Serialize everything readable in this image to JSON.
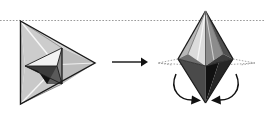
{
  "figure": {
    "width": 264,
    "height": 115,
    "background_color": "#ffffff",
    "caption": ""
  },
  "colors": {
    "outline": "#1a1a1a",
    "dotted_guide": "#9a9a9a",
    "face_light": "#d6d6d6",
    "face_mid": "#b3b3b3",
    "face_midlight": "#c4c4c4",
    "face_dark": "#6e6e6e",
    "face_darker": "#3c3c3c",
    "face_black": "#111111",
    "face_white": "#f2f2f2",
    "arrow": "#111111"
  },
  "guide_line": {
    "name": "horizontal-dotted-guide",
    "y": 20.5,
    "x_start": 0,
    "x_end": 264,
    "dash": "1.6 1.6",
    "color": "#9a9a9a"
  },
  "left_shape": {
    "label": "tetrahedron",
    "vertices": {
      "top_left": [
        20.5,
        21
      ],
      "bottom_left": [
        20.5,
        104
      ],
      "right": [
        95,
        63
      ],
      "inner_top": [
        62,
        48
      ],
      "inner_bottom": [
        62,
        84
      ],
      "inner_left": [
        25,
        66
      ],
      "inner_center": [
        57,
        66
      ]
    },
    "faces": [
      {
        "name": "outer-upper-face",
        "fill": "#d6d6d6",
        "points": "20.5,21 95,63 62,48"
      },
      {
        "name": "outer-lower-face",
        "fill": "#cfcfcf",
        "points": "20.5,104 95,63 62,84"
      },
      {
        "name": "outer-left-face",
        "fill": "#c4c4c4",
        "points": "20.5,21 20.5,104 25,66"
      },
      {
        "name": "inner-upper-left-face",
        "fill": "#f2f2f2",
        "points": "25,66 62,48 57,66"
      },
      {
        "name": "inner-lower-left-face",
        "fill": "#3c3c3c",
        "points": "25,66 62,84 57,66"
      },
      {
        "name": "inner-right-upper-face",
        "fill": "#8c8c8c",
        "points": "62,48 62,84 57,66"
      },
      {
        "name": "inner-dark-wedge",
        "fill": "#111111",
        "points": "25,66 37,72 44,84 62,84"
      }
    ],
    "edges": [
      {
        "name": "edge-outer-top",
        "points": "20.5,21 95,63"
      },
      {
        "name": "edge-outer-bottom",
        "points": "20.5,104 95,63"
      },
      {
        "name": "edge-outer-left",
        "points": "20.5,21 20.5,104"
      },
      {
        "name": "edge-inner-vertical",
        "points": "62,48 62,84"
      },
      {
        "name": "edge-inner-upper-left",
        "points": "25,66 62,48"
      },
      {
        "name": "edge-inner-lower-left",
        "points": "25,66 62,84"
      },
      {
        "name": "edge-inner-center-up",
        "points": "57,66 62,48"
      },
      {
        "name": "edge-inner-center-down",
        "points": "57,66 62,84"
      },
      {
        "name": "edge-inner-center-left",
        "points": "25,66 57,66"
      },
      {
        "name": "edge-midline",
        "points": "25,66 95,63"
      }
    ],
    "highlight_lines": [
      {
        "name": "crease-highlight-upper",
        "points": "20.5,21 57,66",
        "color": "#f2f2f2"
      },
      {
        "name": "crease-highlight-lower",
        "points": "20.5,104 57,66",
        "color": "#f2f2f2"
      }
    ]
  },
  "transform_arrow": {
    "name": "transformation-arrow",
    "from": [
      112,
      62
    ],
    "to": [
      146,
      62
    ],
    "color": "#111111",
    "label": ""
  },
  "right_shape": {
    "label": "bipyramid",
    "vertices": {
      "apex_top": [
        205.5,
        11
      ],
      "apex_bottom": [
        205.5,
        103
      ],
      "equator_left": [
        178,
        59
      ],
      "equator_right": [
        233,
        59
      ],
      "equator_front": [
        205.5,
        66
      ],
      "equator_back_left": [
        188,
        54
      ],
      "equator_back_right": [
        223,
        54
      ]
    },
    "faces": [
      {
        "name": "upper-left-face",
        "fill": "#b3b3b3",
        "points": "205.5,11 178,59 188,54"
      },
      {
        "name": "upper-leftmid-face",
        "fill": "#d6d6d6",
        "points": "205.5,11 188,54 205.5,66"
      },
      {
        "name": "upper-rightmid-face",
        "fill": "#8c8c8c",
        "points": "205.5,11 205.5,66 223,54"
      },
      {
        "name": "upper-right-face",
        "fill": "#5c5c5c",
        "points": "205.5,11 223,54 233,59"
      },
      {
        "name": "lower-left-face",
        "fill": "#4a4a4a",
        "points": "178,59 205.5,66 205.5,103"
      },
      {
        "name": "lower-mid-face",
        "fill": "#1a1a1a",
        "points": "205.5,66 205.5,103 219,62"
      },
      {
        "name": "lower-right-face",
        "fill": "#2b2b2b",
        "points": "219,62 233,59 205.5,103"
      },
      {
        "name": "equator-band-left",
        "fill": "#6e6e6e",
        "points": "178,59 188,54 205.5,66"
      },
      {
        "name": "equator-band-right",
        "fill": "#3c3c3c",
        "points": "223,54 233,59 205.5,66"
      }
    ],
    "edges": [
      {
        "name": "edge-apex-to-left",
        "points": "205.5,11 178,59"
      },
      {
        "name": "edge-apex-to-right",
        "points": "205.5,11 233,59"
      },
      {
        "name": "edge-apex-to-front",
        "points": "205.5,11 205.5,66"
      },
      {
        "name": "edge-apex-to-backleft",
        "points": "205.5,11 188,54"
      },
      {
        "name": "edge-apex-to-backright",
        "points": "205.5,11 223,54"
      },
      {
        "name": "edge-bottom-to-left",
        "points": "205.5,103 178,59"
      },
      {
        "name": "edge-bottom-to-right",
        "points": "205.5,103 233,59"
      },
      {
        "name": "edge-bottom-to-front",
        "points": "205.5,103 205.5,66"
      },
      {
        "name": "edge-equator-left-front",
        "points": "178,59 205.5,66"
      },
      {
        "name": "edge-equator-front-right",
        "points": "205.5,66 233,59"
      },
      {
        "name": "edge-equator-left-backleft",
        "points": "178,59 188,54"
      },
      {
        "name": "edge-equator-backright-right",
        "points": "223,54 233,59"
      }
    ],
    "highlight_lines": [
      {
        "name": "apex-highlight-left",
        "points": "205.5,11 199,62",
        "color": "#f2f2f2"
      },
      {
        "name": "apex-highlight-right",
        "points": "205.5,11 214,60",
        "color": "#cfcfcf"
      }
    ],
    "dotted_flaps": [
      {
        "name": "dotted-flap-left",
        "points": "178,59 158,63 205.5,66"
      },
      {
        "name": "dotted-flap-right",
        "points": "233,59 255,63 205.5,66"
      }
    ],
    "motion_arrows": [
      {
        "name": "fold-arrow-left",
        "path": "M 176,76 C 170,92 182,102 197,101",
        "head": [
          198,
          101
        ],
        "head_angle": -12
      },
      {
        "name": "fold-arrow-right",
        "path": "M 236,76 C 242,92 230,102 215,101",
        "head": [
          214,
          101
        ],
        "head_angle": 192
      }
    ]
  }
}
